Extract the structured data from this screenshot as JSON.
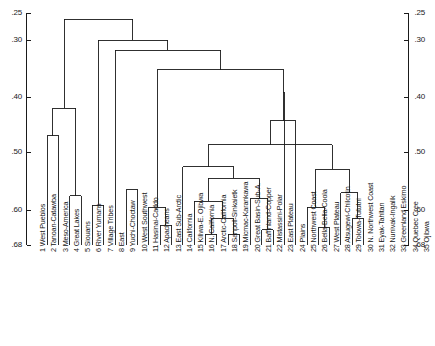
{
  "figure": {
    "kind": "dendrogram",
    "title_fragment": "",
    "background": "#ffffff",
    "line_color": "#1a1a1a"
  },
  "chart_data": {
    "type": "dendrogram",
    "title": "",
    "subtitle": "",
    "xlabel": "",
    "ylabel": "",
    "orientation": "top-down",
    "axis": {
      "position": [
        "left",
        "right"
      ],
      "direction": "increasing-downward",
      "ticks": [
        {
          "label": ".25",
          "value": 0.25,
          "y": 13
        },
        {
          "label": ".30",
          "value": 0.3,
          "y": 40
        },
        {
          "label": ".40",
          "value": 0.4,
          "y": 97
        },
        {
          "label": ".50",
          "value": 0.5,
          "y": 152
        },
        {
          "label": ".60",
          "value": 0.6,
          "y": 210
        },
        {
          "label": ".68",
          "value": 0.68,
          "y": 245
        }
      ],
      "range": [
        0.25,
        0.68
      ],
      "grid": false
    },
    "legend": {
      "entries": [],
      "position": "none"
    },
    "leaves": [
      {
        "index": 1,
        "label": "1 West Pueblos"
      },
      {
        "index": 2,
        "label": "2 Tanoan-Catawba"
      },
      {
        "index": 3,
        "label": "3 Meso-America"
      },
      {
        "index": 4,
        "label": "4 Great Lakes"
      },
      {
        "index": 5,
        "label": "5 Siouans"
      },
      {
        "index": 6,
        "label": "6 River Yumans"
      },
      {
        "index": 7,
        "label": "7 Village Tribes"
      },
      {
        "index": 8,
        "label": "8 East"
      },
      {
        "index": 9,
        "label": "9 Yuchi-Choctaw"
      },
      {
        "index": 10,
        "label": "10 West Southwest"
      },
      {
        "index": 11,
        "label": "11 Hasinai-Caddo"
      },
      {
        "index": 12,
        "label": "12 Apacheans"
      },
      {
        "index": 13,
        "label": "13 East Sub-Arctic"
      },
      {
        "index": 14,
        "label": "14 California"
      },
      {
        "index": 15,
        "label": "15 Kiliwa-E. Ojibwa"
      },
      {
        "index": 16,
        "label": "16 N. California"
      },
      {
        "index": 17,
        "label": "17 Arctic-California"
      },
      {
        "index": 18,
        "label": "18 Sanpoil-Sinkaietk"
      },
      {
        "index": 19,
        "label": "19 Micmac-Karankawa"
      },
      {
        "index": 20,
        "label": "20 Great Basin-Sub-A."
      },
      {
        "index": 21,
        "label": "21 Baffinland-Copper"
      },
      {
        "index": 22,
        "label": "22 Mistassini-Polar"
      },
      {
        "index": 23,
        "label": "23 East Plateau"
      },
      {
        "index": 24,
        "label": "24 Plains"
      },
      {
        "index": 25,
        "label": "25 Northwest Coast"
      },
      {
        "index": 26,
        "label": "26 Bella-Bella-Coola"
      },
      {
        "index": 27,
        "label": "27 West Plateau"
      },
      {
        "index": 28,
        "label": "28 Atsugewi-Chilcotin"
      },
      {
        "index": 29,
        "label": "29 Tolowa-Tututni"
      },
      {
        "index": 30,
        "label": "30 N. Northwest Coast"
      },
      {
        "index": 31,
        "label": "31 Eyak-Tahltan"
      },
      {
        "index": 32,
        "label": "32 Nunivak-Ingalik"
      },
      {
        "index": 33,
        "label": "33 Greenland Eskimo"
      },
      {
        "index": 34,
        "label": "34 Quebec Cree"
      },
      {
        "index": 35,
        "label": "35 Ojibwa"
      }
    ],
    "merges": [
      {
        "id": "m1",
        "left": 4,
        "right": 5,
        "height": 0.575
      },
      {
        "id": "m2",
        "left": 9,
        "right": 10,
        "height": 0.565
      },
      {
        "id": "m3",
        "left": 12,
        "right": 13,
        "height": 0.635
      },
      {
        "id": "m4",
        "left": 11,
        "right": "m3",
        "height": 0.595
      },
      {
        "id": "m5",
        "left": 16,
        "right": 17,
        "height": 0.655
      },
      {
        "id": "m6",
        "left": 18,
        "right": 19,
        "height": 0.655
      },
      {
        "id": "m7",
        "left": "m5",
        "right": "m6",
        "height": 0.62
      },
      {
        "id": "m8",
        "left": 15,
        "right": "m7",
        "height": 0.585
      },
      {
        "id": "m9",
        "left": 21,
        "right": 22,
        "height": 0.645
      },
      {
        "id": "m10",
        "left": 20,
        "right": "m9",
        "height": 0.58
      },
      {
        "id": "m11",
        "left": "m8",
        "right": "m10",
        "height": 0.545
      },
      {
        "id": "m12",
        "left": 14,
        "right": "m11",
        "height": 0.525
      },
      {
        "id": "m13",
        "left": 26,
        "right": 27,
        "height": 0.64
      },
      {
        "id": "m14",
        "left": 25,
        "right": "m13",
        "height": 0.595
      },
      {
        "id": "m15",
        "left": 29,
        "right": 30,
        "height": 0.62
      },
      {
        "id": "m16",
        "left": 28,
        "right": "m15",
        "height": 0.57
      },
      {
        "id": "m17",
        "left": "m14",
        "right": "m16",
        "height": 0.53
      },
      {
        "id": "m18",
        "left": "m12",
        "right": "m17",
        "height": 0.487
      },
      {
        "id": "m19",
        "left": 24,
        "right": "m18",
        "height": 0.443
      },
      {
        "id": "m20",
        "left": 23,
        "right": "m19",
        "height": 0.392
      },
      {
        "id": "m21",
        "left": "m4",
        "right": "m20",
        "height": 0.352
      },
      {
        "id": "m22",
        "left": 8,
        "right": "m21",
        "height": 0.318
      },
      {
        "id": "m23",
        "left": 6,
        "right": 7,
        "height": 0.592
      },
      {
        "id": "m24",
        "left": "m23",
        "right": "m22",
        "height": 0.3
      },
      {
        "id": "m25",
        "left": 2,
        "right": 3,
        "height": 0.47
      },
      {
        "id": "m26",
        "left": "m1",
        "right": "m25",
        "height": 0.42
      },
      {
        "id": "m27",
        "left": "m26",
        "right": "m24",
        "height": 0.262
      }
    ]
  },
  "axis_labels_left": [
    ".25",
    ".30",
    ".40",
    ".50",
    ".60",
    ".68"
  ],
  "axis_labels_right": [
    ".25",
    ".30",
    ".40",
    ".50",
    ".60",
    ".68"
  ]
}
